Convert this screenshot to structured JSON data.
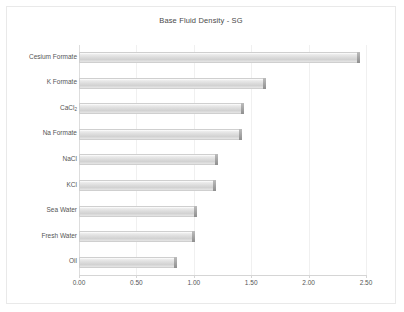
{
  "chart_data": {
    "type": "bar",
    "orientation": "horizontal",
    "title": "Base Fluid Density - SG",
    "xlabel": "",
    "ylabel": "",
    "xlim": [
      0.0,
      2.5
    ],
    "xticks": [
      "0.00",
      "0.50",
      "1.00",
      "1.50",
      "2.00",
      "2.50"
    ],
    "xtick_values": [
      0.0,
      0.5,
      1.0,
      1.5,
      2.0,
      2.5
    ],
    "grid": true,
    "legend": "none",
    "categories": [
      "Cesium Formate",
      "K Formate",
      "CaCl2",
      "Na Formate",
      "NaCl",
      "KCl",
      "Sea Water",
      "Fresh Water",
      "Oil"
    ],
    "category_labels_html": [
      "Cesium Formate",
      "K Formate",
      "CaCl<sub>2</sub>",
      "Na Formate",
      "NaCl",
      "KCl",
      "Sea Water",
      "Fresh Water",
      "Oil"
    ],
    "values": [
      2.45,
      1.63,
      1.44,
      1.42,
      1.21,
      1.19,
      1.03,
      1.01,
      0.85
    ],
    "bar_color": "#d8d8d8",
    "bar_edge_color": "#9d9d9d",
    "grid_color": "#f0f0f0",
    "text_color": "#555555",
    "background": "#ffffff"
  }
}
